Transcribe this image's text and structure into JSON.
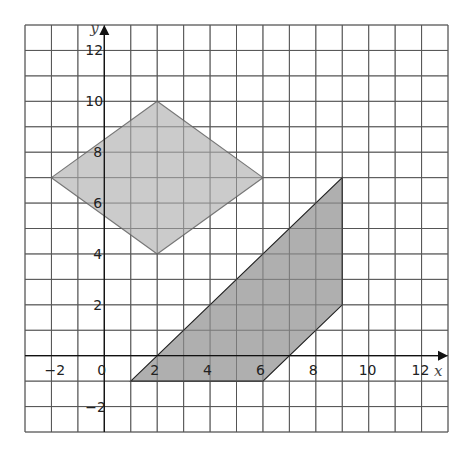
{
  "diagram": {
    "x_range": [
      -3,
      13
    ],
    "y_range": [
      -3,
      13
    ],
    "axis_labels": {
      "x": "x",
      "y": "y"
    },
    "x_ticks": [
      {
        "value": -2,
        "label": "−2"
      },
      {
        "value": 0,
        "label": "0"
      },
      {
        "value": 2,
        "label": "2"
      },
      {
        "value": 4,
        "label": "4"
      },
      {
        "value": 6,
        "label": "6"
      },
      {
        "value": 8,
        "label": "8"
      },
      {
        "value": 10,
        "label": "10"
      },
      {
        "value": 12,
        "label": "12"
      }
    ],
    "y_ticks": [
      {
        "value": 12,
        "label": "12"
      },
      {
        "value": 10,
        "label": "10"
      },
      {
        "value": 8,
        "label": "8"
      },
      {
        "value": 6,
        "label": "6"
      },
      {
        "value": 4,
        "label": "4"
      },
      {
        "value": 2,
        "label": "2"
      },
      {
        "value": -2,
        "label": "−2"
      }
    ],
    "shapes": [
      {
        "name": "rhombus",
        "vertices": [
          [
            -2,
            7
          ],
          [
            2,
            10
          ],
          [
            6,
            7
          ],
          [
            2,
            4
          ]
        ],
        "fill": "#c8c8c8",
        "stroke": "#777777"
      },
      {
        "name": "trapezium",
        "vertices": [
          [
            1,
            -1
          ],
          [
            9,
            7
          ],
          [
            9,
            2
          ],
          [
            6,
            -1
          ]
        ],
        "fill": "#ababab",
        "stroke": "#222222"
      }
    ]
  }
}
